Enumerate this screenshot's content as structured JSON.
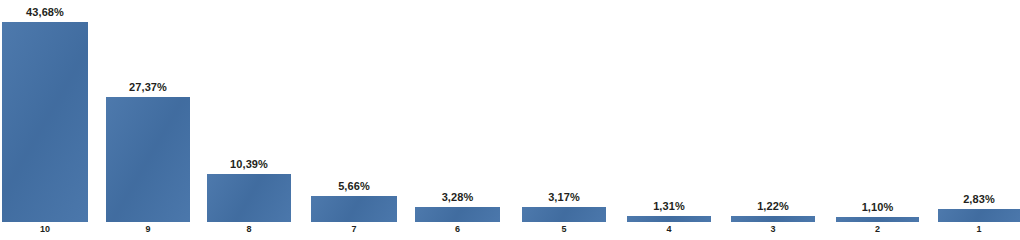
{
  "chart_data": {
    "type": "bar",
    "title": "",
    "subtitle": "",
    "xlabel": "",
    "ylabel": "",
    "categories": [
      "10",
      "9",
      "8",
      "7",
      "6",
      "5",
      "4",
      "3",
      "2",
      "1"
    ],
    "values": [
      43.68,
      27.37,
      10.39,
      5.66,
      3.28,
      3.17,
      1.31,
      1.22,
      1.1,
      2.83
    ],
    "value_labels": [
      "43,68%",
      "27,37%",
      "10,39%",
      "5,66%",
      "3,28%",
      "3,17%",
      "1,31%",
      "1,22%",
      "1,10%",
      "2,83%"
    ],
    "ylim": [
      0,
      43.68
    ],
    "grid": false,
    "legend": null,
    "series": [
      {
        "name": "",
        "color": "#4472a8",
        "values": [
          43.68,
          27.37,
          10.39,
          5.66,
          3.28,
          3.17,
          1.31,
          1.22,
          1.1,
          2.83
        ]
      }
    ],
    "bar_color": "#4472a8",
    "label_color": "#231f20"
  },
  "bars": [
    {
      "category": "10",
      "value": 43.68,
      "label": "43,68%",
      "left": 2,
      "width": 86
    },
    {
      "category": "9",
      "value": 27.37,
      "label": "27,37%",
      "left": 106,
      "width": 84
    },
    {
      "category": "8",
      "value": 10.39,
      "label": "10,39%",
      "left": 207,
      "width": 84
    },
    {
      "category": "7",
      "value": 5.66,
      "label": "5,66%",
      "left": 311,
      "width": 86
    },
    {
      "category": "6",
      "value": 3.28,
      "label": "3,28%",
      "left": 415,
      "width": 85
    },
    {
      "category": "5",
      "value": 3.17,
      "label": "3,17%",
      "left": 522,
      "width": 84
    },
    {
      "category": "4",
      "value": 1.31,
      "label": "1,31%",
      "left": 627,
      "width": 84
    },
    {
      "category": "3",
      "value": 1.22,
      "label": "1,22%",
      "left": 731,
      "width": 84
    },
    {
      "category": "2",
      "value": 1.1,
      "label": "1,10%",
      "left": 836,
      "width": 83
    },
    {
      "category": "1",
      "value": 2.83,
      "label": "2,83%",
      "left": 938,
      "width": 82
    }
  ]
}
